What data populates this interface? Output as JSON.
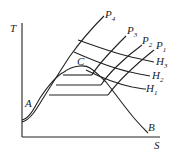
{
  "diagram": {
    "type": "T-S diagram",
    "axes": {
      "y_label": "T",
      "x_label": "S"
    },
    "points": {
      "A": "A",
      "B": "B",
      "C": "C"
    },
    "isobars": [
      {
        "letter": "P",
        "sub": "1"
      },
      {
        "letter": "P",
        "sub": "2"
      },
      {
        "letter": "P",
        "sub": "3"
      },
      {
        "letter": "P",
        "sub": "4"
      }
    ],
    "isenthalps": [
      {
        "letter": "H",
        "sub": "1"
      },
      {
        "letter": "H",
        "sub": "2"
      },
      {
        "letter": "H",
        "sub": "3"
      }
    ],
    "colors": {
      "line": "#222222",
      "background": "#ffffff"
    }
  }
}
